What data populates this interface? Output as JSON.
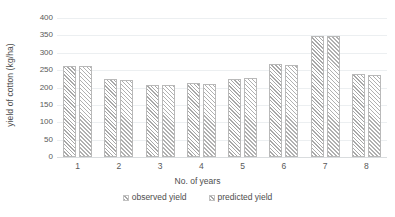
{
  "chart_data": {
    "type": "bar",
    "title": "",
    "xlabel": "No. of years",
    "ylabel": "yield of cotton (kg/ha)",
    "categories": [
      "1",
      "2",
      "3",
      "4",
      "5",
      "6",
      "7",
      "8"
    ],
    "series": [
      {
        "name": "observed yield",
        "values": [
          263,
          224,
          207,
          213,
          225,
          268,
          348,
          240
        ]
      },
      {
        "name": "predicted yield",
        "values": [
          263,
          222,
          207,
          211,
          228,
          265,
          347,
          237
        ]
      }
    ],
    "ylim": [
      0,
      400
    ],
    "yticks": [
      0,
      50,
      100,
      150,
      200,
      250,
      300,
      350,
      400
    ],
    "ytick_labels": [
      "0",
      "50",
      "100",
      "150",
      "200",
      "250",
      "300",
      "350",
      "400"
    ],
    "grid": true,
    "legend_position": "bottom",
    "colors": {
      "series_observed": "#a8a8a8",
      "series_predicted": "#b0b0b0",
      "gridline": "#eceff1",
      "axis_line": "#d9dcde",
      "text": "#4d4d4d",
      "tick_text": "#595959",
      "background": "#ffffff"
    }
  }
}
